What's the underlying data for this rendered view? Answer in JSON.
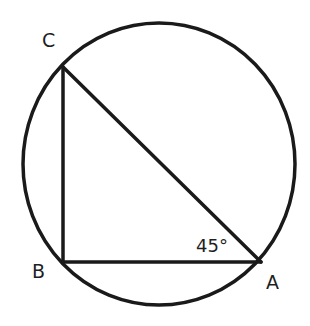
{
  "diagram": {
    "type": "geometry",
    "colors": {
      "stroke": "#1a1a1a",
      "background": "#ffffff",
      "text": "#1f1f1f"
    },
    "circle": {
      "cx": 159,
      "cy": 164,
      "rx": 136,
      "ry": 141
    },
    "points": {
      "A": {
        "x": 261,
        "y": 262,
        "label": "A"
      },
      "B": {
        "x": 63,
        "y": 262,
        "label": "B"
      },
      "C": {
        "x": 63,
        "y": 67,
        "label": "C"
      }
    },
    "segments": [
      {
        "from": "B",
        "to": "A",
        "name": "BA"
      },
      {
        "from": "B",
        "to": "C",
        "name": "BC"
      },
      {
        "from": "C",
        "to": "A",
        "name": "CA"
      }
    ],
    "labels": {
      "A": "A",
      "B": "B",
      "C": "C",
      "angle_A": "45°"
    }
  }
}
